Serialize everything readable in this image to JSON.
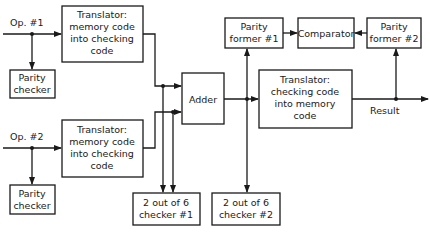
{
  "diagram": {
    "inputs": {
      "op1": "Op. #1",
      "op2": "Op. #2"
    },
    "output": {
      "result": "Result"
    },
    "blocks": {
      "translator1": [
        "Translator:",
        "memory code",
        "into checking",
        "code"
      ],
      "translator2": [
        "Translator:",
        "memory code",
        "into checking",
        "code"
      ],
      "parity_checker1": [
        "Parity",
        "checker"
      ],
      "parity_checker2": [
        "Parity",
        "checker"
      ],
      "adder": [
        "Adder"
      ],
      "checker1": [
        "2 out of 6",
        "checker #1"
      ],
      "checker2": [
        "2 out of 6",
        "checker #2"
      ],
      "parity_former1": [
        "Parity",
        "former #1"
      ],
      "parity_former2": [
        "Parity",
        "former #2"
      ],
      "comparator": [
        "Comparator"
      ],
      "translator3": [
        "Translator:",
        "checking code",
        "into memory",
        "code"
      ]
    }
  }
}
